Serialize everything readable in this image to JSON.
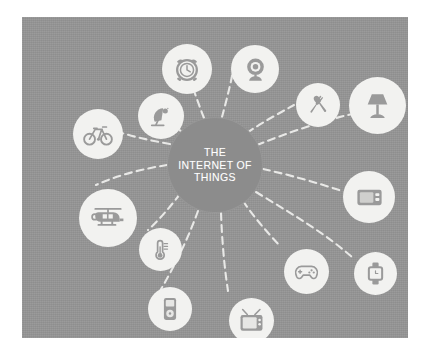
{
  "panel": {
    "background_color": "#949494",
    "page_background_color": "#ffffff"
  },
  "center": {
    "label": "THE\nINTERNET OF\nTHINGS",
    "line1": "THE",
    "line2": "INTERNET OF",
    "line3": "THINGS",
    "fill_color": "#8c8c8c",
    "text_color": "#ffffff"
  },
  "connectors": {
    "style": "dashed",
    "color": "#f0f0ee",
    "count": 12
  },
  "nodes": [
    {
      "id": "alarm-clock",
      "icon": "alarm-clock-icon",
      "label": "Alarm Clock",
      "x": 140,
      "y": 27,
      "size": 50
    },
    {
      "id": "webcam",
      "icon": "webcam-icon",
      "label": "Webcam",
      "x": 209,
      "y": 28,
      "size": 48
    },
    {
      "id": "kitchen",
      "icon": "fork-spoon-icon",
      "label": "Kitchen",
      "x": 274,
      "y": 66,
      "size": 44
    },
    {
      "id": "lamp",
      "icon": "table-lamp-icon",
      "label": "Lamp",
      "x": 327,
      "y": 60,
      "size": 57
    },
    {
      "id": "media-player",
      "icon": "media-player-icon",
      "label": "Media Player",
      "x": 321,
      "y": 154,
      "size": 52
    },
    {
      "id": "smartwatch",
      "icon": "smartwatch-icon",
      "label": "Smartwatch",
      "x": 332,
      "y": 235,
      "size": 43
    },
    {
      "id": "game-controller",
      "icon": "game-controller-icon",
      "label": "Game Controller",
      "x": 262,
      "y": 232,
      "size": 45
    },
    {
      "id": "television",
      "icon": "television-icon",
      "label": "Television",
      "x": 207,
      "y": 281,
      "size": 45
    },
    {
      "id": "music-player",
      "icon": "music-player-icon",
      "label": "Music Player",
      "x": 126,
      "y": 270,
      "size": 44
    },
    {
      "id": "thermometer",
      "icon": "thermometer-icon",
      "label": "Thermometer",
      "x": 117,
      "y": 211,
      "size": 43
    },
    {
      "id": "helicopter",
      "icon": "helicopter-icon",
      "label": "Drone",
      "x": 57,
      "y": 172,
      "size": 58
    },
    {
      "id": "bicycle",
      "icon": "bicycle-icon",
      "label": "Bicycle",
      "x": 51,
      "y": 92,
      "size": 50
    },
    {
      "id": "satellite-dish",
      "icon": "satellite-dish-icon",
      "label": "Satellite Dish",
      "x": 116,
      "y": 76,
      "size": 46
    }
  ],
  "icon_colors": {
    "bubble_fill": "#f2f2f0",
    "glyph_fill": "#9a9a9a"
  }
}
